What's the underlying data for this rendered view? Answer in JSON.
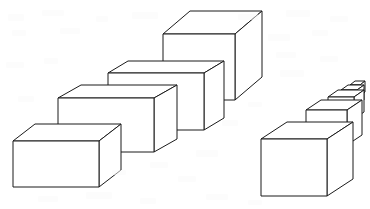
{
  "scene": {
    "title": "Perspective Cubes Illustration",
    "description": "Two receding rows of wireframe rectangular boxes drawn in linear perspective on a plain white background",
    "width": 370,
    "height": 209,
    "background_color": "#ffffff",
    "line_color": "#1b1b1b",
    "face_fill_color": "#ffffff",
    "line_width": 1,
    "shape_count": 9,
    "group_count": 2
  },
  "groups": [
    {
      "id": "left-row",
      "label": "Left row of boxes",
      "direction": "receding up and to the right",
      "box_count": 4
    },
    {
      "id": "right-row",
      "label": "Right row of boxes",
      "direction": "receding up and to the right, diminishing",
      "box_count": 5
    }
  ],
  "boxes": [
    {
      "id": "left-box-1",
      "group": "left-row",
      "order": 1,
      "size_rank": "smallest-in-row",
      "front": "13,141 13,187 99,187 99,141",
      "top": "13,141 35,124 121,124 99,141",
      "side": "99,141 121,124 121,170 99,187"
    },
    {
      "id": "left-box-2",
      "group": "left-row",
      "order": 2,
      "size_rank": "second",
      "front": "58,98 58,152 154,152 154,98",
      "top": "58,98 81,85 177,85 154,98",
      "side": "154,98 177,85 177,139 154,152"
    },
    {
      "id": "left-box-3",
      "group": "left-row",
      "order": 3,
      "size_rank": "third",
      "front": "108,73 108,130 204,130 204,73",
      "top": "108,73 128,61 224,61 204,73",
      "side": "204,73 224,61 224,118 204,130"
    },
    {
      "id": "left-box-4",
      "group": "left-row",
      "order": 4,
      "size_rank": "largest",
      "front": "163,34 163,100 235,100 235,34",
      "top": "163,34 190,11 262,11 235,34",
      "side": "235,34 262,11 262,77 235,100"
    },
    {
      "id": "right-box-1",
      "group": "right-row",
      "order": 1,
      "size_rank": "largest-in-row",
      "front": "261,139 261,196 327,196 327,139",
      "top": "261,139 287,122 353,122 327,139",
      "side": "327,139 353,122 353,179 327,196"
    },
    {
      "id": "right-box-2",
      "group": "right-row",
      "order": 2,
      "size_rank": "second",
      "front": "306,110 306,145 347,145 347,110",
      "top": "306,110 321,100 362,100 347,110",
      "side": "347,110 362,100 362,135 347,145"
    },
    {
      "id": "right-box-3",
      "group": "right-row",
      "order": 3,
      "size_rank": "third",
      "front": "328,97 328,119 354,119 354,97",
      "top": "328,97 338,90 364,90 354,97",
      "side": "354,97 364,90 364,112 354,119"
    },
    {
      "id": "right-box-4",
      "group": "right-row",
      "order": 4,
      "size_rank": "fourth",
      "front": "341,90 341,105 357,105 357,90",
      "top": "341,90 348,85 364,85 357,90",
      "side": "357,90 364,85 364,100 357,105"
    },
    {
      "id": "right-box-5",
      "group": "right-row",
      "order": 5,
      "size_rank": "smallest",
      "front": "350,85 350,96 360,96 360,85",
      "top": "350,85 355,81 365,81 360,85",
      "side": "360,85 365,81 365,92 360,96"
    }
  ],
  "specks": [
    {
      "x": 8,
      "y": 14,
      "w": 16,
      "h": 7
    },
    {
      "x": 42,
      "y": 10,
      "w": 22,
      "h": 6
    },
    {
      "x": 96,
      "y": 16,
      "w": 12,
      "h": 6
    },
    {
      "x": 132,
      "y": 12,
      "w": 26,
      "h": 7
    },
    {
      "x": 238,
      "y": 14,
      "w": 20,
      "h": 6
    },
    {
      "x": 286,
      "y": 10,
      "w": 24,
      "h": 7
    },
    {
      "x": 330,
      "y": 16,
      "w": 18,
      "h": 6
    },
    {
      "x": 12,
      "y": 30,
      "w": 14,
      "h": 6
    },
    {
      "x": 60,
      "y": 28,
      "w": 20,
      "h": 6
    },
    {
      "x": 268,
      "y": 34,
      "w": 22,
      "h": 7
    },
    {
      "x": 312,
      "y": 30,
      "w": 16,
      "h": 6
    },
    {
      "x": 276,
      "y": 52,
      "w": 20,
      "h": 6
    },
    {
      "x": 320,
      "y": 56,
      "w": 18,
      "h": 6
    },
    {
      "x": 6,
      "y": 62,
      "w": 18,
      "h": 6
    },
    {
      "x": 44,
      "y": 58,
      "w": 14,
      "h": 6
    },
    {
      "x": 280,
      "y": 70,
      "w": 24,
      "h": 7
    },
    {
      "x": 18,
      "y": 96,
      "w": 16,
      "h": 6
    },
    {
      "x": 196,
      "y": 150,
      "w": 22,
      "h": 7
    },
    {
      "x": 150,
      "y": 162,
      "w": 18,
      "h": 6
    },
    {
      "x": 38,
      "y": 196,
      "w": 20,
      "h": 6
    },
    {
      "x": 86,
      "y": 192,
      "w": 26,
      "h": 7
    },
    {
      "x": 140,
      "y": 198,
      "w": 16,
      "h": 6
    },
    {
      "x": 206,
      "y": 194,
      "w": 22,
      "h": 6
    },
    {
      "x": 248,
      "y": 200,
      "w": 14,
      "h": 5
    },
    {
      "x": 178,
      "y": 176,
      "w": 18,
      "h": 6
    },
    {
      "x": 112,
      "y": 170,
      "w": 14,
      "h": 5
    },
    {
      "x": 222,
      "y": 120,
      "w": 16,
      "h": 6
    },
    {
      "x": 248,
      "y": 102,
      "w": 14,
      "h": 5
    }
  ]
}
